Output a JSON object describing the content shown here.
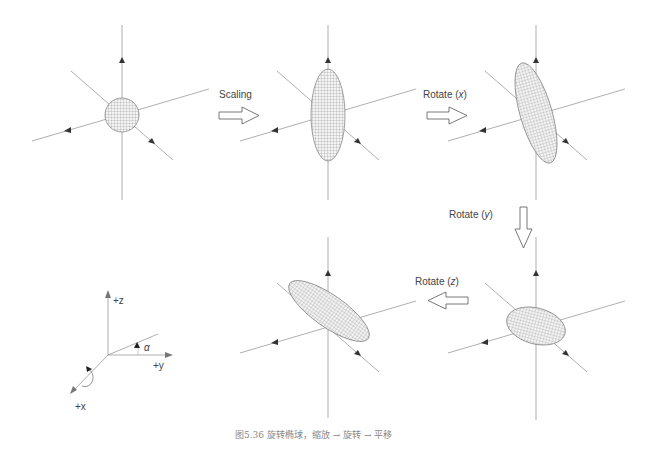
{
  "figure": {
    "caption": "图5.36   旋转椭球，缩放 → 旋转 → 平移",
    "stages": [
      {
        "id": "sphere",
        "shape": "sphere"
      },
      {
        "id": "scaled",
        "shape": "vertical-ellipsoid"
      },
      {
        "id": "rotated-x",
        "shape": "tilted-ellipsoid"
      },
      {
        "id": "rotated-y",
        "shape": "flattened-ellipsoid"
      },
      {
        "id": "rotated-z",
        "shape": "diagonal-ellipsoid"
      }
    ],
    "transitions": [
      {
        "label": "Scaling",
        "direction": "right"
      },
      {
        "label_prefix": "Rotate (",
        "axis": "x",
        "label_suffix": ")",
        "direction": "right"
      },
      {
        "label_prefix": "Rotate (",
        "axis": "y",
        "label_suffix": ")",
        "direction": "down"
      },
      {
        "label_prefix": "Rotate (",
        "axis": "z",
        "label_suffix": ")",
        "direction": "left"
      }
    ],
    "axes_legend": {
      "z_label": "+z",
      "y_label": "+y",
      "x_label": "+x",
      "angle_label": "α"
    },
    "colors": {
      "axis": "#9a9a9a",
      "mesh": "#666666",
      "text": "#444444",
      "caption": "#888888"
    }
  }
}
